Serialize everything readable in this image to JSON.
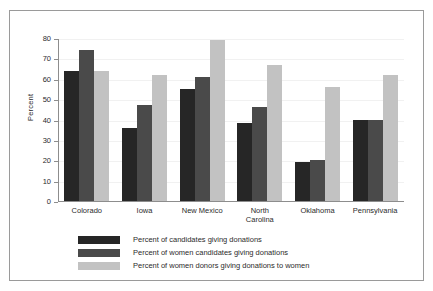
{
  "chart_data": {
    "type": "bar",
    "title": "",
    "xlabel": "",
    "ylabel": "Percent",
    "ylim": [
      0,
      80
    ],
    "yticks": [
      0,
      10,
      20,
      30,
      40,
      50,
      60,
      70,
      80
    ],
    "ytick_labels": [
      "0",
      "10",
      "20",
      "30",
      "40",
      "50",
      "60",
      "70",
      "80"
    ],
    "grid": true,
    "legend_position": "bottom-left",
    "categories": [
      "Colorado",
      "Iowa",
      "New Mexico",
      "North Carolina",
      "Oklahoma",
      "Pennsylvania"
    ],
    "category_label_lines": [
      [
        "Colorado"
      ],
      [
        "Iowa"
      ],
      [
        "New Mexico"
      ],
      [
        "North",
        "Carolina"
      ],
      [
        "Oklahoma"
      ],
      [
        "Pennsylvania"
      ]
    ],
    "series": [
      {
        "name": "Percent of candidates giving donations",
        "color": "#262626",
        "values": [
          64,
          36,
          55,
          38.5,
          19,
          40
        ]
      },
      {
        "name": "Percent of women candidates giving donations",
        "color": "#4a4a4a",
        "values": [
          74,
          47,
          61,
          46,
          20,
          40
        ]
      },
      {
        "name": "Percent of women donors giving donations to women",
        "color": "#c2c2c2",
        "values": [
          64,
          62,
          79,
          67,
          56,
          62
        ]
      }
    ]
  }
}
